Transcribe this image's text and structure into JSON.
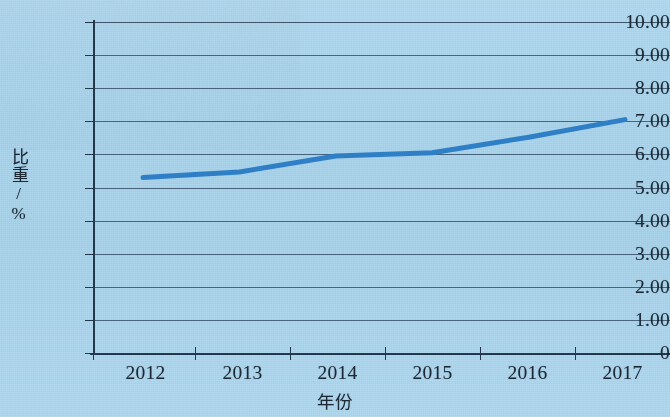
{
  "chart_data": {
    "type": "line",
    "title": "",
    "xlabel": "年份",
    "ylabel": "比重/%",
    "categories": [
      "2012",
      "2013",
      "2014",
      "2015",
      "2016",
      "2017"
    ],
    "x_tick_labels": [
      "2012",
      "2013",
      "2014",
      "2015",
      "2016",
      "2017"
    ],
    "y_tick_labels": [
      "10.00",
      "9.00",
      "8.00",
      "7.00",
      "6.00",
      "5.00",
      "4.00",
      "3.00",
      "2.00",
      "1.00",
      "0"
    ],
    "y_tick_values": [
      10,
      9,
      8,
      7,
      6,
      5,
      4,
      3,
      2,
      1,
      0
    ],
    "ylim": [
      0,
      10
    ],
    "grid": "horizontal",
    "legend": "none",
    "series": [
      {
        "name": "比重",
        "values": [
          5.3,
          5.47,
          5.95,
          6.05,
          6.52,
          7.05
        ],
        "color": "#2f7fc6",
        "line_width": 5,
        "markers": "none"
      }
    ],
    "colors": {
      "background": "#a9d5ee",
      "axis": "#24384c",
      "gridline": "#39506a",
      "series": "#2f7fc6",
      "text": "#1d2a36"
    }
  },
  "axis": {
    "y_title_main": "比重",
    "y_title_unit": "/%",
    "x_title": "年份"
  }
}
